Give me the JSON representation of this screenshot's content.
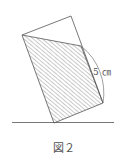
{
  "figure": {
    "caption": "図２",
    "label": "5 ㎝",
    "colors": {
      "stroke": "#555555",
      "hatch": "#777777",
      "background": "#ffffff"
    }
  }
}
